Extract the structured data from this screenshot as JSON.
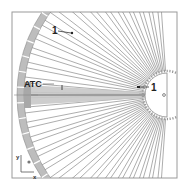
{
  "figure": {
    "type": "schematic",
    "colors": {
      "frame": "#9a9a9a",
      "rim_fill": "#bdbdbd",
      "rod_stroke": "#8a8a8a",
      "highlight_fill": "#c8c8c8",
      "highlight_core": "#9e9e9e",
      "text": "#222222"
    },
    "geometry": {
      "frame": {
        "x": 12,
        "y": 12,
        "width": 165,
        "height": 166
      },
      "hub_center": {
        "x": 167,
        "y": 95
      },
      "hub_radius": 22,
      "rim_inner_radius": 143,
      "rim_outer_radius": 150,
      "rod_count": 28
    }
  },
  "labels": {
    "rim_element": "1",
    "hub_element": "1",
    "highlighted_rod": "ATC"
  },
  "axes": {
    "y_label": "y",
    "x_label": "x",
    "z_symbol": "⊙"
  },
  "center_marker": "o"
}
